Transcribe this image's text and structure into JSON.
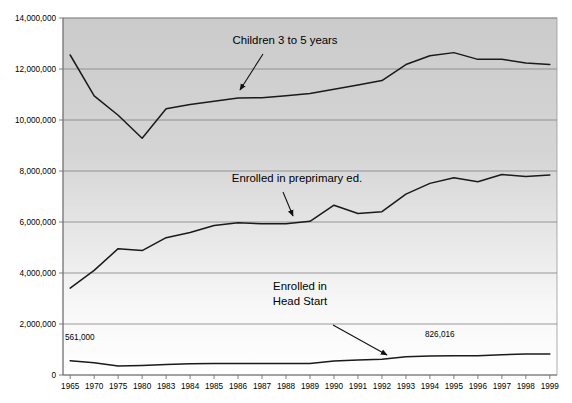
{
  "chart_data": {
    "type": "line",
    "title": "",
    "subtitle": "",
    "xlabel": "",
    "ylabel": "",
    "grid": true,
    "legend_position": "inline-annotations",
    "ylim": [
      0,
      14000000
    ],
    "ytick_labels": [
      "0",
      "2,000,000",
      "4,000,000",
      "6,000,000",
      "8,000,000",
      "10,000,000",
      "12,000,000",
      "14,000,000"
    ],
    "ytick_values": [
      0,
      2000000,
      4000000,
      6000000,
      8000000,
      10000000,
      12000000,
      14000000
    ],
    "categories": [
      "1965",
      "1970",
      "1975",
      "1980",
      "1983",
      "1984",
      "1985",
      "1986",
      "1987",
      "1988",
      "1989",
      "1990",
      "1991",
      "1992",
      "1993",
      "1994",
      "1995",
      "1996",
      "1997",
      "1998",
      "1999"
    ],
    "series": [
      {
        "name": "Children 3 to 5 years",
        "values": [
          12549000,
          10949000,
          10185000,
          9284000,
          10438000,
          10612000,
          10733000,
          10866000,
          10872000,
          10953000,
          11039000,
          11207000,
          11370000,
          11545000,
          12176000,
          12518000,
          12642000,
          12378000,
          12381000,
          12238000,
          12174000
        ]
      },
      {
        "name": "Enrolled in preprimary ed.",
        "values": [
          3407000,
          4104000,
          4955000,
          4878000,
          5384000,
          5591000,
          5865000,
          5971000,
          5931000,
          5931000,
          6026000,
          6659000,
          6334000,
          6403000,
          7095000,
          7514000,
          7739000,
          7580000,
          7860000,
          7788000,
          7844000
        ]
      },
      {
        "name": "Enrolled in Head Start",
        "values": [
          561000,
          477400,
          349000,
          376300,
          414950,
          442140,
          452080,
          451732,
          446523,
          448464,
          450970,
          548470,
          583471,
          621078,
          713903,
          740493,
          750696,
          752077,
          794000,
          822316,
          826016
        ]
      }
    ],
    "annotations": [
      {
        "id": "label-children",
        "text": "Children 3 to 5 years",
        "x_px": 285,
        "y_px": 44,
        "arrow_from": [
          263,
          54
        ],
        "arrow_to": [
          240,
          90
        ]
      },
      {
        "id": "label-preprimary",
        "text": "Enrolled in preprimary ed.",
        "x_px": 297,
        "y_px": 182,
        "arrow_from": [
          283,
          192
        ],
        "arrow_to": [
          293,
          216
        ]
      },
      {
        "id": "label-headstart-line1",
        "text": "Enrolled in",
        "x_px": 300,
        "y_px": 290,
        "arrow_from": null,
        "arrow_to": null
      },
      {
        "id": "label-headstart-line2",
        "text": "Head Start",
        "x_px": 300,
        "y_px": 305,
        "arrow_from": [
          333,
          325
        ],
        "arrow_to": [
          387,
          355
        ]
      }
    ],
    "data_labels": [
      {
        "id": "headstart-start-value",
        "text": "561,000",
        "x_px": 65,
        "y_px": 340
      },
      {
        "id": "headstart-end-value",
        "text": "826,016",
        "x_px": 425,
        "y_px": 337
      }
    ],
    "colors": {
      "line": "#1a1a1a",
      "gridline": "#808080",
      "plot_background_top": "#cfcfcf",
      "plot_background_bottom": "#ffffff",
      "page_background": "#ffffff",
      "text": "#000000"
    }
  }
}
